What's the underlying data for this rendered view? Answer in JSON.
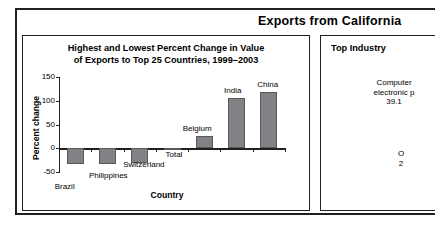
{
  "header": {
    "title": "Exports from California"
  },
  "left_panel": {
    "title_line1": "Highest and Lowest Percent Change in Value",
    "title_line2": "of Exports to Top 25 Countries, 1999–2003"
  },
  "right_panel": {
    "title": "Top Industry",
    "slice1_line1": "Computer",
    "slice1_line2": "electronic p",
    "slice1_value": "39.1",
    "slice2_line1": "O",
    "slice2_value": "2"
  },
  "chart_data": {
    "type": "bar",
    "title": "Highest and Lowest Percent Change in Value of Exports to Top 25 Countries, 1999–2003",
    "xlabel": "Country",
    "ylabel": "Percent change",
    "categories": [
      "Brazil",
      "Philippines",
      "Switzerland",
      "Total",
      "Belgium",
      "India",
      "China"
    ],
    "values": [
      -33,
      -33,
      -32,
      -2,
      25,
      105,
      118
    ],
    "ylim": [
      -50,
      150
    ],
    "yticks": [
      -50,
      0,
      50,
      100,
      150
    ],
    "ytick_labels": [
      "-50",
      "0",
      "50",
      "100",
      "150"
    ],
    "grid": false,
    "legend": false,
    "bar_color": "#808285"
  }
}
